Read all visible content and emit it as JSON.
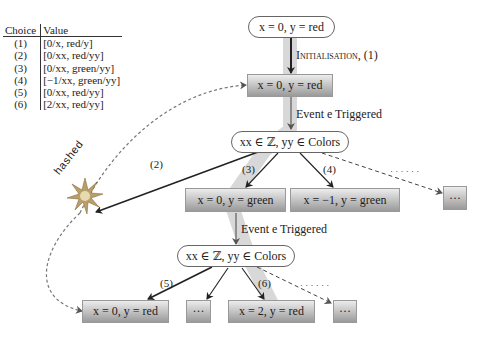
{
  "table": {
    "headers": [
      "Choice",
      "Value"
    ],
    "rows": [
      {
        "choice": "(1)",
        "value": "[0/x, red/y]"
      },
      {
        "choice": "(2)",
        "value": "[0/xx, red/yy]"
      },
      {
        "choice": "(3)",
        "value": "[0/xx, green/yy]"
      },
      {
        "choice": "(4)",
        "value": "[−1/xx, green/yy]"
      },
      {
        "choice": "(5)",
        "value": "[0/xx, red/yy]"
      },
      {
        "choice": "(6)",
        "value": "[2/xx, red/yy]"
      }
    ]
  },
  "nodes": {
    "root": "x = 0, y = red",
    "init_state": "x = 0, y = red",
    "choice1": "xx ∈ ℤ, yy ∈ Colors",
    "green0": "x = 0, y = green",
    "green_m1": "x = −1, y = green",
    "ellipsis1": "···",
    "choice2": "xx ∈ ℤ, yy ∈ Colors",
    "red0": "x = 0, y = red",
    "ellipsis2": "···",
    "red2": "x = 2, y = red",
    "ellipsis3": "···"
  },
  "edges": {
    "init": "Initialisation, (1)",
    "event1": "Event e Triggered",
    "event2": "Event e Triggered",
    "c2": "(2)",
    "c3": "(3)",
    "c4": "(4)",
    "c5": "(5)",
    "c6": "(6)",
    "hashed": "hashed",
    "dots1": "· · · · · ·",
    "dots2": "· · · · · ·"
  }
}
